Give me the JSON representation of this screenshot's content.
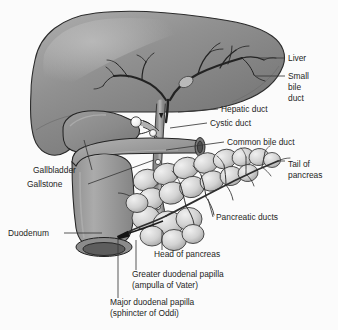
{
  "figure": {
    "background_color": "#fbfbfb",
    "text_color": "#1d1d1d",
    "leader_line_color": "#3a3a3a"
  },
  "palette": {
    "liver_mid": "#8d8d8d",
    "liver_dark": "#6f6f6f",
    "liver_light": "#a9a9a9",
    "gallbladder": "#8a8a8a",
    "duodenum": "#9a9a9a",
    "duodenum_dark": "#6b6b6b",
    "pancreas": "#d5d5d5",
    "pancreas_shade": "#b4b4b4",
    "duct": "#9c9c9c",
    "duct_outline": "#2f2f2f",
    "gallstone": "#f4f4f4",
    "outline": "#262626"
  },
  "labels": [
    {
      "id": "liver",
      "name": "Liver",
      "lines": [
        "Liver"
      ],
      "x": 288,
      "y": 61,
      "anchor": "start"
    },
    {
      "id": "small-bile-duct",
      "name": "Small bile duct",
      "lines": [
        "Small",
        "bile",
        "duct"
      ],
      "x": 288,
      "y": 79,
      "anchor": "start"
    },
    {
      "id": "hepatic-duct",
      "name": "Hepatic duct",
      "lines": [
        "Hepatic duct"
      ],
      "x": 221,
      "y": 112,
      "anchor": "start"
    },
    {
      "id": "cystic-duct",
      "name": "Cystic duct",
      "lines": [
        "Cystic duct"
      ],
      "x": 210,
      "y": 126,
      "anchor": "start"
    },
    {
      "id": "common-bile-duct",
      "name": "Common bile duct",
      "lines": [
        "Common bile duct"
      ],
      "x": 227,
      "y": 145,
      "anchor": "start"
    },
    {
      "id": "tail-of-pancreas",
      "name": "Tail of pancreas",
      "lines": [
        "Tail of",
        "pancreas"
      ],
      "x": 288,
      "y": 167,
      "anchor": "start"
    },
    {
      "id": "gallbladder",
      "name": "Gallbladder",
      "lines": [
        "Gallbladder"
      ],
      "x": 33,
      "y": 173,
      "anchor": "start"
    },
    {
      "id": "gallstone",
      "name": "Gallstone",
      "lines": [
        "Gallstone"
      ],
      "x": 27,
      "y": 187,
      "anchor": "start"
    },
    {
      "id": "pancreatic-ducts",
      "name": "Pancreatic ducts",
      "lines": [
        "Pancreatic ducts"
      ],
      "x": 216,
      "y": 220,
      "anchor": "start"
    },
    {
      "id": "duodenum",
      "name": "Duodenum",
      "lines": [
        "Duodenum"
      ],
      "x": 8,
      "y": 236,
      "anchor": "start"
    },
    {
      "id": "head-of-pancreas",
      "name": "Head of pancreas",
      "lines": [
        "Head of  pancreas"
      ],
      "x": 154,
      "y": 257,
      "anchor": "start"
    },
    {
      "id": "greater-papilla",
      "name": "Greater duodenal papilla",
      "lines": [
        "Greater duodenal papilla",
        "(ampulla of Vater)"
      ],
      "x": 132,
      "y": 277,
      "anchor": "start"
    },
    {
      "id": "major-papilla",
      "name": "Major duodenal papilla",
      "lines": [
        "Major duodenal papilla",
        "(sphincter of Oddi)"
      ],
      "x": 110,
      "y": 305,
      "anchor": "start"
    }
  ],
  "structures": [
    {
      "id": "liver",
      "name": "Liver"
    },
    {
      "id": "gallbladder",
      "name": "Gallbladder"
    },
    {
      "id": "gallstones",
      "name": "Gallstones"
    },
    {
      "id": "biliary-tree",
      "name": "Intrahepatic bile ducts"
    },
    {
      "id": "hepatic-duct",
      "name": "Hepatic duct"
    },
    {
      "id": "cystic-duct",
      "name": "Cystic duct"
    },
    {
      "id": "common-bile-duct",
      "name": "Common bile duct"
    },
    {
      "id": "duodenum",
      "name": "Duodenum"
    },
    {
      "id": "pancreas",
      "name": "Pancreas"
    },
    {
      "id": "pancreatic-duct",
      "name": "Pancreatic duct"
    }
  ]
}
